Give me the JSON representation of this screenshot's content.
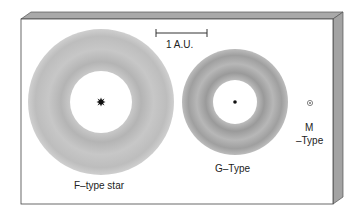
{
  "diagram": {
    "scale_bar": {
      "label": "1 A.U."
    },
    "stars": [
      {
        "id": "f",
        "label": "F–type star"
      },
      {
        "id": "g",
        "label": "G–Type"
      },
      {
        "id": "m",
        "label_line1": "M",
        "label_line2": "–Type"
      }
    ],
    "colors": {
      "zone_dark": "#8f8f8f",
      "zone_light": "#cfcfcf",
      "frame_edge": "#a8a8a8",
      "star": "#111111"
    }
  }
}
